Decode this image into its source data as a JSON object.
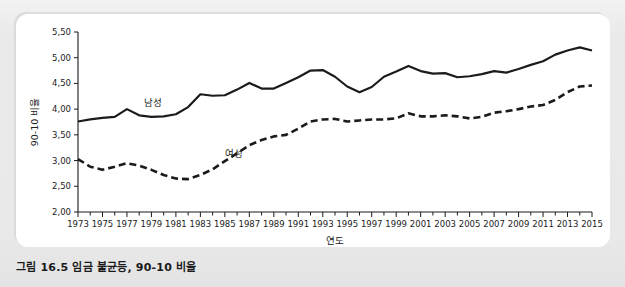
{
  "caption": "그림 16.5  임금 불균등, 90-10 비율",
  "chart_data": {
    "type": "line",
    "title": "",
    "xlabel": "연도",
    "ylabel": "90-10 비율",
    "xlim": [
      1973,
      2015
    ],
    "ylim": [
      2.0,
      5.5
    ],
    "grid": false,
    "legend_position": "inline-annotation",
    "y_ticks": [
      "2,00",
      "2,50",
      "3,00",
      "3,50",
      "4,00",
      "4,50",
      "5,00",
      "5,50"
    ],
    "y_tick_values": [
      2.0,
      2.5,
      3.0,
      3.5,
      4.0,
      4.5,
      5.0,
      5.5
    ],
    "x_ticks": [
      "1973",
      "1975",
      "1977",
      "1979",
      "1981",
      "1983",
      "1985",
      "1987",
      "1989",
      "1991",
      "1993",
      "1995",
      "1997",
      "1999",
      "2001",
      "2003",
      "2005",
      "2007",
      "2009",
      "2011",
      "2013",
      "2015"
    ],
    "x": [
      1973,
      1974,
      1975,
      1976,
      1977,
      1978,
      1979,
      1980,
      1981,
      1982,
      1983,
      1984,
      1985,
      1986,
      1987,
      1988,
      1989,
      1990,
      1991,
      1992,
      1993,
      1994,
      1995,
      1996,
      1997,
      1998,
      1999,
      2000,
      2001,
      2002,
      2003,
      2004,
      2005,
      2006,
      2007,
      2008,
      2009,
      2010,
      2011,
      2012,
      2013,
      2014,
      2015
    ],
    "series": [
      {
        "name": "남성",
        "style": "solid",
        "color": "#1b1b1b",
        "label_x": 1978.4,
        "label_y": 4.07,
        "values": [
          3.76,
          3.8,
          3.83,
          3.85,
          4.0,
          3.88,
          3.85,
          3.86,
          3.9,
          4.04,
          4.29,
          4.26,
          4.27,
          4.38,
          4.51,
          4.4,
          4.4,
          4.51,
          4.62,
          4.75,
          4.76,
          4.63,
          4.44,
          4.33,
          4.43,
          4.63,
          4.73,
          4.84,
          4.74,
          4.69,
          4.7,
          4.62,
          4.64,
          4.68,
          4.74,
          4.71,
          4.78,
          4.86,
          4.93,
          5.06,
          5.14,
          5.2,
          5.14
        ]
      },
      {
        "name": "여성",
        "style": "dashed",
        "color": "#1b1b1b",
        "label_x": 1985.0,
        "label_y": 3.06,
        "values": [
          3.03,
          2.88,
          2.82,
          2.88,
          2.95,
          2.9,
          2.82,
          2.72,
          2.65,
          2.64,
          2.72,
          2.83,
          2.99,
          3.14,
          3.3,
          3.4,
          3.47,
          3.5,
          3.62,
          3.76,
          3.8,
          3.81,
          3.76,
          3.78,
          3.8,
          3.8,
          3.82,
          3.92,
          3.86,
          3.86,
          3.88,
          3.86,
          3.82,
          3.85,
          3.93,
          3.96,
          4.0,
          4.05,
          4.08,
          4.18,
          4.33,
          4.44,
          4.46
        ]
      }
    ]
  }
}
